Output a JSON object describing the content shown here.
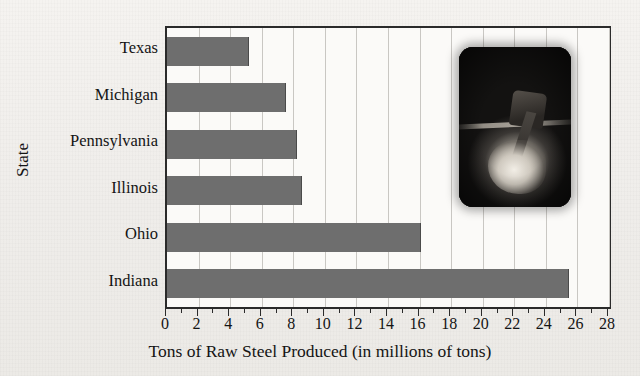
{
  "chart_data": {
    "type": "bar",
    "orientation": "horizontal",
    "title": "",
    "categories": [
      "Texas",
      "Michigan",
      "Pennsylvania",
      "Illinois",
      "Ohio",
      "Indiana"
    ],
    "values": [
      5.1,
      7.5,
      8.2,
      8.5,
      16.0,
      25.4
    ],
    "xlabel": "Tons of Raw Steel Produced (in millions of tons)",
    "ylabel": "State",
    "xlim": [
      0,
      28
    ],
    "xticks": [
      0,
      2,
      4,
      6,
      8,
      10,
      12,
      14,
      16,
      18,
      20,
      22,
      24,
      26,
      28
    ],
    "xtick_labels": [
      "0",
      "2",
      "4",
      "6",
      "8",
      "10",
      "12",
      "14",
      "16",
      "18",
      "20",
      "22",
      "24",
      "26",
      "28"
    ],
    "grid": "vertical-only",
    "legend": "none",
    "bar_color": "#6e6e6e",
    "axis_color": "#2b2b2b",
    "gridline_color": "#c9c7c3",
    "plot_background": "#fbfaf8",
    "page_background": "#f3f1ee"
  },
  "inset": {
    "name": "steel-mill-photo",
    "description": "dark photograph of molten steel pour in a mill"
  }
}
